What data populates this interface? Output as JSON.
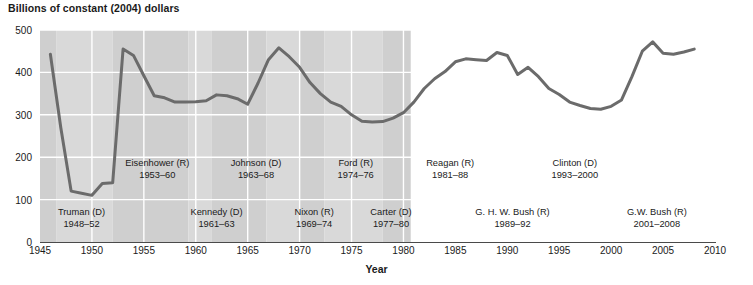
{
  "chart_data": {
    "type": "line",
    "title": "Billions of constant (2004) dollars",
    "xlabel": "Year",
    "ylabel": "",
    "xlim": [
      1945,
      2010
    ],
    "ylim": [
      0,
      500
    ],
    "grid": true,
    "legend": "none",
    "line_color": "#6b6b6b",
    "band_color_a": "#d9d9d9",
    "band_color_b": "#cfcfcf",
    "xticks": [
      1945,
      1950,
      1955,
      1960,
      1965,
      1970,
      1975,
      1980,
      1985,
      1990,
      1995,
      2000,
      2005,
      2010
    ],
    "yticks": [
      0,
      100,
      200,
      300,
      400,
      500
    ],
    "x": [
      1946,
      1947,
      1948,
      1949,
      1950,
      1951,
      1952,
      1953,
      1954,
      1955,
      1956,
      1957,
      1958,
      1959,
      1960,
      1961,
      1962,
      1963,
      1964,
      1965,
      1966,
      1967,
      1968,
      1969,
      1970,
      1971,
      1972,
      1973,
      1974,
      1975,
      1976,
      1977,
      1978,
      1979,
      1980,
      1981,
      1982,
      1983,
      1984,
      1985,
      1986,
      1987,
      1988,
      1989,
      1990,
      1991,
      1992,
      1993,
      1994,
      1995,
      1996,
      1997,
      1998,
      1999,
      2000,
      2001,
      2002,
      2003,
      2004,
      2005,
      2006,
      2007,
      2008
    ],
    "values": [
      443,
      270,
      120,
      115,
      110,
      138,
      140,
      455,
      440,
      392,
      345,
      340,
      330,
      330,
      331,
      333,
      347,
      345,
      338,
      325,
      375,
      430,
      458,
      437,
      412,
      376,
      350,
      330,
      320,
      300,
      285,
      283,
      284,
      292,
      305,
      330,
      362,
      385,
      402,
      425,
      432,
      430,
      428,
      447,
      440,
      395,
      412,
      390,
      362,
      348,
      330,
      322,
      315,
      313,
      320,
      335,
      390,
      450,
      472,
      445,
      443,
      448,
      455
    ],
    "annotations": [
      {
        "name": "Truman (D)",
        "years": "1948–52",
        "row": "lower",
        "x_center": 1949.0
      },
      {
        "name": "Eisenhower (R)",
        "years": "1953–60",
        "row": "upper",
        "x_center": 1956.3
      },
      {
        "name": "Kennedy (D)",
        "years": "1961–63",
        "row": "lower",
        "x_center": 1962.0
      },
      {
        "name": "Johnson (D)",
        "years": "1963–68",
        "row": "upper",
        "x_center": 1965.8
      },
      {
        "name": "Nixon (R)",
        "years": "1969–74",
        "row": "lower",
        "x_center": 1971.4
      },
      {
        "name": "Ford (R)",
        "years": "1974–76",
        "row": "upper",
        "x_center": 1975.4
      },
      {
        "name": "Carter (D)",
        "years": "1977–80",
        "row": "lower",
        "x_center": 1978.8
      },
      {
        "name": "Reagan (R)",
        "years": "1981–88",
        "row": "upper",
        "x_center": 1984.5
      },
      {
        "name": "G. H. W. Bush (R)",
        "years": "1989–92",
        "row": "lower",
        "x_center": 1990.5
      },
      {
        "name": "Clinton (D)",
        "years": "1993–2000",
        "row": "upper",
        "x_center": 1996.5
      },
      {
        "name": "G.W. Bush (R)",
        "years": "2001–2008",
        "row": "lower",
        "x_center": 2004.4
      }
    ],
    "term_bands": [
      {
        "from": 1945.0,
        "to": 1946.6,
        "shade": "b"
      },
      {
        "from": 1946.6,
        "to": 1952.0,
        "shade": "a"
      },
      {
        "from": 1952.0,
        "to": 1959.3,
        "shade": "b"
      },
      {
        "from": 1959.3,
        "to": 1961.5,
        "shade": "a"
      },
      {
        "from": 1961.5,
        "to": 1966.8,
        "shade": "b"
      },
      {
        "from": 1966.8,
        "to": 1970.0,
        "shade": "a"
      },
      {
        "from": 1970.0,
        "to": 1972.4,
        "shade": "b"
      },
      {
        "from": 1972.4,
        "to": 1978.0,
        "shade": "a"
      },
      {
        "from": 1978.0,
        "to": 1980.7,
        "shade": "b"
      },
      {
        "from": 1980.7,
        "to": 1588.3,
        "shade": "a"
      }
    ]
  }
}
